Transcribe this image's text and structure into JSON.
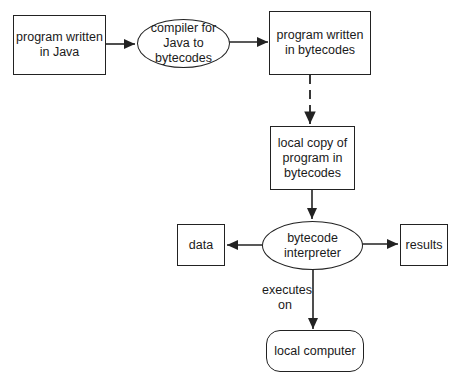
{
  "diagram": {
    "nodes": {
      "java_source": {
        "text": "program written\nin Java",
        "shape": "rectangle"
      },
      "compiler": {
        "text": "compiler for\nJava to\nbytecodes",
        "shape": "ellipse"
      },
      "bytecode_program": {
        "text": "program written\nin bytecodes",
        "shape": "rectangle"
      },
      "local_copy": {
        "text": "local copy of\nprogram in\nbytecodes",
        "shape": "rectangle"
      },
      "interpreter": {
        "text": "bytecode\ninterpreter",
        "shape": "ellipse"
      },
      "data": {
        "text": "data",
        "shape": "rectangle"
      },
      "results": {
        "text": "results",
        "shape": "rectangle"
      },
      "local_computer": {
        "text": "local computer",
        "shape": "rounded-rectangle"
      }
    },
    "edges": [
      {
        "from": "java_source",
        "to": "compiler",
        "style": "solid"
      },
      {
        "from": "compiler",
        "to": "bytecode_program",
        "style": "solid"
      },
      {
        "from": "bytecode_program",
        "to": "local_copy",
        "style": "dashed"
      },
      {
        "from": "local_copy",
        "to": "interpreter",
        "style": "solid"
      },
      {
        "from": "interpreter",
        "to": "data",
        "style": "solid"
      },
      {
        "from": "interpreter",
        "to": "results",
        "style": "solid"
      },
      {
        "from": "interpreter",
        "to": "local_computer",
        "style": "solid",
        "label": "executes\non"
      }
    ],
    "edge_labels": {
      "executes_on": "executes\non"
    },
    "colors": {
      "stroke": "#222222",
      "background": "#ffffff"
    }
  }
}
